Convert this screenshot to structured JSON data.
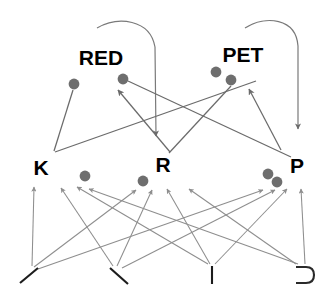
{
  "diagram": {
    "background_color": "#ffffff",
    "edge_color": "#6b6b6b",
    "dot_color": "#6e6e6e",
    "label_color": "#000000",
    "upper_nodes": [
      {
        "id": "RED",
        "label": "RED",
        "x": 101,
        "y": 65
      },
      {
        "id": "PET",
        "label": "PET",
        "x": 243,
        "y": 62
      }
    ],
    "middle_nodes": [
      {
        "id": "K",
        "label": "K",
        "x": 41,
        "y": 175
      },
      {
        "id": "R",
        "label": "R",
        "x": 163,
        "y": 172
      },
      {
        "id": "P",
        "label": "P",
        "x": 297,
        "y": 173
      }
    ],
    "bottom_glyphs": [
      {
        "id": "slash",
        "label": "/",
        "x": 29,
        "y": 275
      },
      {
        "id": "backslash",
        "label": "\\",
        "x": 118,
        "y": 275
      },
      {
        "id": "bar",
        "label": "|",
        "x": 212,
        "y": 274
      },
      {
        "id": "rightbracket",
        "label": "⊃",
        "x": 303,
        "y": 274
      }
    ],
    "attachment_dots": [
      {
        "owner": "RED",
        "x": 74,
        "y": 84
      },
      {
        "owner": "RED",
        "x": 123,
        "y": 79
      },
      {
        "owner": "PET",
        "x": 216,
        "y": 72
      },
      {
        "owner": "PET",
        "x": 231,
        "y": 79
      },
      {
        "owner": "K",
        "x": 85,
        "y": 176
      },
      {
        "owner": "R",
        "x": 143,
        "y": 181
      },
      {
        "owner": "P",
        "x": 268,
        "y": 174
      },
      {
        "owner": "P",
        "x": 277,
        "y": 182
      }
    ],
    "self_loops": [
      {
        "from": "RED",
        "to": "R",
        "start_x": 97,
        "start_y": 28,
        "end_x": 156,
        "end_y": 142
      },
      {
        "from": "PET",
        "to": "P",
        "start_x": 245,
        "start_y": 28,
        "end_x": 298,
        "end_y": 135
      }
    ],
    "upper_edges": [
      {
        "from": "K",
        "to": "RED",
        "x1": 54,
        "y1": 151,
        "x2": 73,
        "y2": 90
      },
      {
        "from": "P",
        "to": "RED",
        "x1": 255,
        "y1": 80,
        "x2": 55,
        "y2": 152
      },
      {
        "from": "R",
        "to": "RED",
        "x1": 168,
        "y1": 150,
        "x2": 119,
        "y2": 88
      },
      {
        "from": "K",
        "to": "PET",
        "x1": 90,
        "y1": 85,
        "x2": 290,
        "y2": 155
      },
      {
        "from": "R",
        "to": "PET",
        "x1": 230,
        "y1": 86,
        "x2": 168,
        "y2": 152
      },
      {
        "from": "P",
        "to": "PET",
        "x1": 280,
        "y1": 148,
        "x2": 248,
        "y2": 86
      }
    ],
    "lower_edges": [
      {
        "from": "slash",
        "to": "K",
        "x1": 34,
        "y1": 266,
        "x2": 35,
        "y2": 188
      },
      {
        "from": "backslash",
        "to": "K",
        "x1": 112,
        "y1": 266,
        "x2": 62,
        "y2": 189
      },
      {
        "from": "bar",
        "to": "K",
        "x1": 210,
        "y1": 264,
        "x2": 78,
        "y2": 188
      },
      {
        "from": "rightbracket",
        "to": "K",
        "x1": 300,
        "y1": 264,
        "x2": 90,
        "y2": 190
      },
      {
        "from": "slash",
        "to": "R",
        "x1": 36,
        "y1": 266,
        "x2": 135,
        "y2": 190
      },
      {
        "from": "backslash",
        "to": "R",
        "x1": 116,
        "y1": 266,
        "x2": 152,
        "y2": 191
      },
      {
        "from": "bar",
        "to": "R",
        "x1": 207,
        "y1": 264,
        "x2": 166,
        "y2": 190
      },
      {
        "from": "rightbracket",
        "to": "R",
        "x1": 297,
        "y1": 264,
        "x2": 188,
        "y2": 190
      },
      {
        "from": "slash",
        "to": "P",
        "x1": 40,
        "y1": 266,
        "x2": 262,
        "y2": 190
      },
      {
        "from": "backslash",
        "to": "P",
        "x1": 122,
        "y1": 266,
        "x2": 274,
        "y2": 190
      },
      {
        "from": "bar",
        "to": "P",
        "x1": 216,
        "y1": 264,
        "x2": 286,
        "y2": 190
      },
      {
        "from": "rightbracket",
        "to": "P",
        "x1": 306,
        "y1": 264,
        "x2": 300,
        "y2": 190
      }
    ]
  }
}
